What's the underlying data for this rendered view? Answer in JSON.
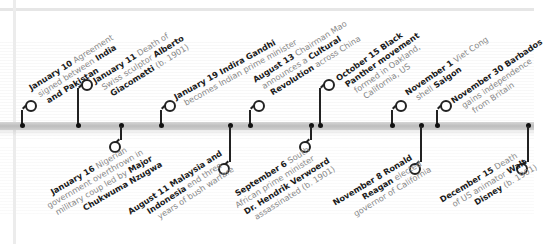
{
  "timeline": {
    "events_above": [
      {
        "date": "January 10",
        "lines": [
          [
            "Agreement"
          ],
          [
            "signed between ",
            "India"
          ],
          [
            "",
            "and Pakistan"
          ]
        ],
        "bold_map": [
          [
            false
          ],
          [
            false,
            true
          ],
          [
            false,
            true
          ]
        ]
      },
      {
        "date": "January 11",
        "lines": [
          [
            "Death of"
          ],
          [
            "Swiss sculptor ",
            "Alberto"
          ],
          [
            "",
            "Giacometti",
            " (b. 1901)"
          ]
        ]
      },
      {
        "date": "January 19",
        "lines": [
          [
            "",
            "Indira Gandhi"
          ],
          [
            "becomes Indian prime minister"
          ]
        ]
      },
      {
        "date": "August 13",
        "lines": [
          [
            "Chairman Mao"
          ],
          [
            "announces a ",
            "Cultural"
          ],
          [
            "",
            "Revolution",
            " across China"
          ]
        ]
      },
      {
        "date": "October 15",
        "lines": [
          [
            "",
            "Black"
          ],
          [
            "",
            "Panther movement"
          ],
          [
            "formed in Oakland,"
          ],
          [
            "California, US"
          ]
        ]
      },
      {
        "date": "November 1",
        "lines": [
          [
            "Viet Cong"
          ],
          [
            "shell ",
            "Saigon"
          ]
        ]
      },
      {
        "date": "November 30",
        "lines": [
          [
            "",
            "Barbados"
          ],
          [
            "gains independence"
          ],
          [
            "from Britain"
          ]
        ]
      }
    ],
    "events_below": [
      {
        "date": "January 16",
        "lines": [
          [
            "Nigerian"
          ],
          [
            "government overthrown in"
          ],
          [
            "military coup led by ",
            "Major"
          ],
          [
            "",
            "Chukwuma Nzugwa"
          ]
        ]
      },
      {
        "date": "August 11",
        "lines": [
          [
            "",
            "Malaysia and"
          ],
          [
            "",
            "Indonesia",
            " end three"
          ],
          [
            "years of bush warfare"
          ]
        ]
      },
      {
        "date": "September 6",
        "lines": [
          [
            "South"
          ],
          [
            "African prime minister"
          ],
          [
            "",
            "Dr. Hendrik Verwoerd"
          ],
          [
            "assassinated (b. 1901)"
          ]
        ]
      },
      {
        "date": "November 8",
        "lines": [
          [
            "",
            "Ronald"
          ],
          [
            "",
            "Reagan",
            " elected"
          ],
          [
            "governor of California"
          ]
        ]
      },
      {
        "date": "December 15",
        "lines": [
          [
            "Death"
          ],
          [
            "of US animator ",
            "Walt"
          ],
          [
            "",
            "Disney",
            " (b. 1901)"
          ]
        ]
      }
    ]
  },
  "text": {
    "a0_date": "January 10",
    "a0_l1": " Agreement",
    "a0_l2a": "signed between ",
    "a0_l2b": "India",
    "a0_l3": "and Pakistan",
    "a1_date": "January 11",
    "a1_l1": " Death of",
    "a1_l2a": "Swiss sculptor ",
    "a1_l2b": "Alberto",
    "a1_l3a": "Giacometti",
    "a1_l3b": " (b. 1901)",
    "a2_date": "January 19",
    "a2_l1": " Indira Gandhi",
    "a2_l2": "becomes Indian prime minister",
    "a3_date": "August 13",
    "a3_l1": " Chairman Mao",
    "a3_l2a": "announces a ",
    "a3_l2b": "Cultural",
    "a3_l3a": "Revolution",
    "a3_l3b": " across China",
    "a4_date": "October 15",
    "a4_l1": " Black",
    "a4_l2": "Panther movement",
    "a4_l3": "formed in Oakland,",
    "a4_l4": "California, US",
    "a5_date": "November 1",
    "a5_l1": " Viet Cong",
    "a5_l2a": "shell ",
    "a5_l2b": "Saigon",
    "a6_date": "November 30",
    "a6_l1": " Barbados",
    "a6_l2": "gains independence",
    "a6_l3": "from Britain",
    "b0_date": "January 16",
    "b0_l1": " Nigerian",
    "b0_l2": "government overthrown in",
    "b0_l3a": "military coup led by ",
    "b0_l3b": "Major",
    "b0_l4": "Chukwuma Nzugwa",
    "b1_date": "August 11",
    "b1_l1": " Malaysia and",
    "b1_l2a": "Indonesia",
    "b1_l2b": " end three",
    "b1_l3": "years of bush warfare",
    "b2_date": "September 6",
    "b2_l1": " South",
    "b2_l2": "African prime minister",
    "b2_l3": "Dr. Hendrik Verwoerd",
    "b2_l4": "assassinated (b. 1901)",
    "b3_date": "November 8",
    "b3_l1": " Ronald",
    "b3_l2a": "Reagan",
    "b3_l2b": " elected",
    "b3_l3": "governor of California",
    "b4_date": "December 15",
    "b4_l1": " Death",
    "b4_l2a": "of US animator ",
    "b4_l2b": "Walt",
    "b4_l3a": "Disney",
    "b4_l3b": " (b. 1901)"
  },
  "colors": {
    "bar": "#c6c6c6",
    "pin": "#222222",
    "text_bold": "#1a1a1a",
    "text_light": "#888888"
  }
}
